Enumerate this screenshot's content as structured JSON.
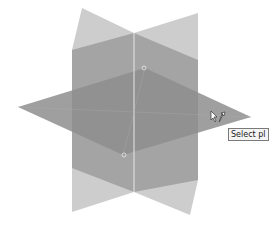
{
  "viewport": {
    "background": "#ffffff",
    "planes": [
      {
        "name": "back-vertical-plane",
        "fill": "#c4c4c4",
        "opacity": 0.85,
        "points": "82,8 134,33 198,13 198,180 190,215 134,192 72,212 72,50"
      },
      {
        "name": "front-vertical-plane",
        "fill": "#9a9a9a",
        "opacity": 0.8,
        "points": "72,50 134,33 198,60 198,180 134,192 72,168"
      },
      {
        "name": "horizontal-plane",
        "fill": "#8e8e8e",
        "opacity": 0.85,
        "points": "18,107 145,68 251,117 123,155"
      }
    ],
    "center_edge": {
      "x1": 134,
      "y1": 33,
      "x2": 134,
      "y2": 192,
      "color": "#e6e6e6"
    },
    "handles": [
      {
        "cx": 144,
        "cy": 68
      },
      {
        "cx": 124,
        "cy": 155
      }
    ],
    "accent": "#7a7a7a"
  },
  "tooltip": {
    "text": "Select pl"
  },
  "cursor": {
    "icon": "move-cursor-icon"
  }
}
